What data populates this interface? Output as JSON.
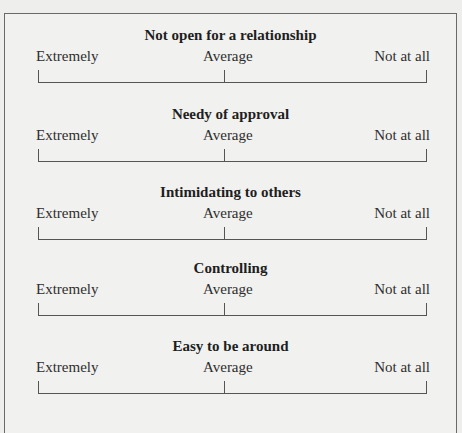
{
  "scales": [
    {
      "title": "Not open for a relationship",
      "left_label": "Extremely",
      "mid_label": "Average",
      "right_label": "Not at all"
    },
    {
      "title": "Needy of approval",
      "left_label": "Extremely",
      "mid_label": "Average",
      "right_label": "Not at all"
    },
    {
      "title": "Intimidating to others",
      "left_label": "Extremely",
      "mid_label": "Average",
      "right_label": "Not at all"
    },
    {
      "title": "Controlling",
      "left_label": "Extremely",
      "mid_label": "Average",
      "right_label": "Not at all"
    },
    {
      "title": "Easy to be around",
      "left_label": "Extremely",
      "mid_label": "Average",
      "right_label": "Not at all"
    }
  ]
}
